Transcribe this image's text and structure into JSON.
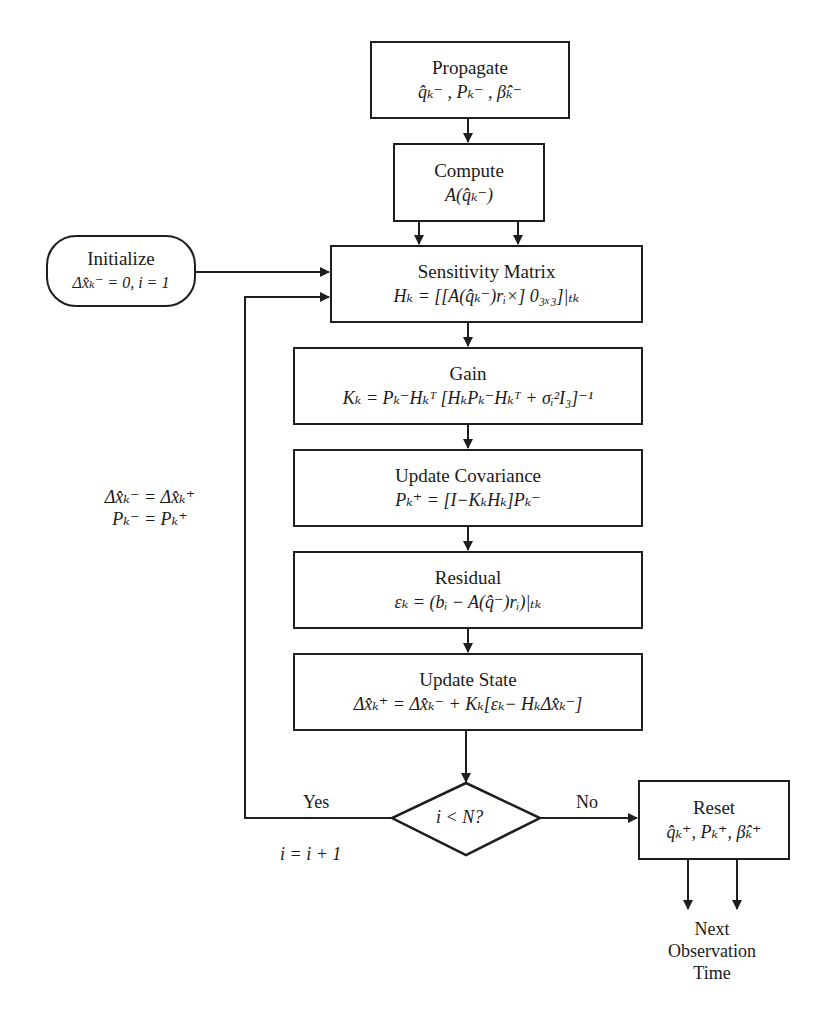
{
  "nodes": {
    "propagate": {
      "title": "Propagate",
      "eq": "q̂ₖ⁻ , Pₖ⁻ , β̂ₖ⁻"
    },
    "compute": {
      "title": "Compute",
      "eq": "A(q̂ₖ⁻)"
    },
    "initialize": {
      "title": "Initialize",
      "eq": "Δx̂ₖ⁻ = 0, i = 1"
    },
    "sensitivity": {
      "title": "Sensitivity Matrix",
      "eq": "Hₖ = [[A(q̂ₖ⁻)rᵢ×] 0₃ₓ₃]|ₜₖ"
    },
    "gain": {
      "title": "Gain",
      "eq": "Kₖ = Pₖ⁻Hₖᵀ [HₖPₖ⁻Hₖᵀ + σᵢ²I₃]⁻¹"
    },
    "update_covariance": {
      "title": "Update Covariance",
      "eq": "Pₖ⁺ = [I−KₖHₖ]Pₖ⁻"
    },
    "residual": {
      "title": "Residual",
      "eq": "εₖ = (bᵢ − A(q̂⁻)rᵢ)|ₜₖ"
    },
    "update_state": {
      "title": "Update State",
      "eq": "Δx̂ₖ⁺ = Δx̂ₖ⁻ + Kₖ[εₖ− HₖΔx̂ₖ⁻]"
    },
    "decision": {
      "eq": "i < N?"
    },
    "reset": {
      "title": "Reset",
      "eq": "q̂ₖ⁺, Pₖ⁺, β̂ₖ⁺"
    }
  },
  "edge_labels": {
    "loop_assign_1": "Δx̂ₖ⁻ = Δx̂ₖ⁺",
    "loop_assign_2": "Pₖ⁻ = Pₖ⁺",
    "yes": "Yes",
    "no": "No",
    "increment": "i = i + 1",
    "next_1": "Next",
    "next_2": "Observation",
    "next_3": "Time"
  },
  "colors": {
    "line": "#1e1e1e",
    "background": "#ffffff"
  }
}
